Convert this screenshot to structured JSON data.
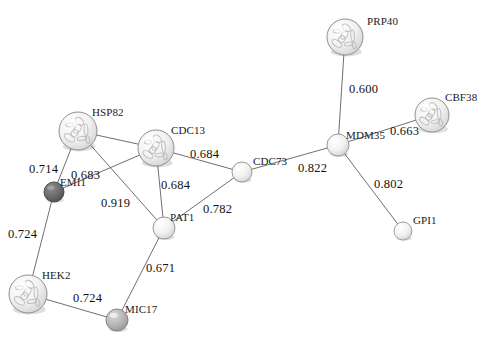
{
  "diagram": {
    "background_color": "#ffffff",
    "edge_color": "#6f6f6f",
    "label_color": "#111111",
    "width": 487,
    "height": 347
  },
  "nodes": [
    {
      "id": "PRP40",
      "label": "PRP40",
      "cx": 345,
      "cy": 37,
      "r": 18,
      "fill": "#e8e8e8",
      "stroke": "#8f8f8f",
      "structured": true,
      "label_dx": 22,
      "label_dy": -22
    },
    {
      "id": "CBF38",
      "label": "CBF38",
      "cx": 432,
      "cy": 115,
      "r": 17,
      "fill": "#e6e6e6",
      "stroke": "#8f8f8f",
      "structured": true,
      "label_dx": 13,
      "label_dy": -24
    },
    {
      "id": "MDM35",
      "label": "MDM35",
      "cx": 338,
      "cy": 145,
      "r": 11,
      "fill": "#efefef",
      "stroke": "#9a9a9a",
      "structured": false,
      "label_dx": 8,
      "label_dy": -16
    },
    {
      "id": "GPI1",
      "label": "GPI1",
      "cx": 403,
      "cy": 231,
      "r": 9,
      "fill": "#f2f2f2",
      "stroke": "#9f9f9f",
      "structured": false,
      "label_dx": 10,
      "label_dy": -17
    },
    {
      "id": "CDC73",
      "label": "CDC73",
      "cx": 242,
      "cy": 172,
      "r": 10,
      "fill": "#f0f0f0",
      "stroke": "#9a9a9a",
      "structured": false,
      "label_dx": 11,
      "label_dy": -17
    },
    {
      "id": "CDC13",
      "label": "CDC13",
      "cx": 156,
      "cy": 148,
      "r": 18,
      "fill": "#ededed",
      "stroke": "#8f8f8f",
      "structured": true,
      "label_dx": 15,
      "label_dy": -24
    },
    {
      "id": "HSP82",
      "label": "HSP82",
      "cx": 78,
      "cy": 131,
      "r": 19,
      "fill": "#ececec",
      "stroke": "#8f8f8f",
      "structured": true,
      "label_dx": 14,
      "label_dy": -25
    },
    {
      "id": "EMI1",
      "label": "EMI1",
      "cx": 54,
      "cy": 192,
      "r": 10,
      "fill": "#6a6a6a",
      "stroke": "#4a4a4a",
      "structured": false,
      "label_dx": 6,
      "label_dy": -16
    },
    {
      "id": "PAT1",
      "label": "PAT1",
      "cx": 164,
      "cy": 228,
      "r": 11,
      "fill": "#ededed",
      "stroke": "#9a9a9a",
      "structured": false,
      "label_dx": 6,
      "label_dy": -17
    },
    {
      "id": "HEK2",
      "label": "HEK2",
      "cx": 28,
      "cy": 294,
      "r": 19,
      "fill": "#ebebeb",
      "stroke": "#8f8f8f",
      "structured": true,
      "label_dx": 14,
      "label_dy": -25
    },
    {
      "id": "MIC17",
      "label": "MIC17",
      "cx": 117,
      "cy": 320,
      "r": 11,
      "fill": "#b4b4b4",
      "stroke": "#858585",
      "structured": false,
      "label_dx": 8,
      "label_dy": -17
    }
  ],
  "edges": [
    {
      "source": "PRP40",
      "target": "MDM35",
      "score": "0.600",
      "label_x": 349,
      "label_y": 82
    },
    {
      "source": "CBF38",
      "target": "MDM35",
      "score": "0.663",
      "label_x": 390,
      "label_y": 124
    },
    {
      "source": "MDM35",
      "target": "GPI1",
      "score": "0.802",
      "label_x": 374,
      "label_y": 177
    },
    {
      "source": "MDM35",
      "target": "CDC73",
      "score": "0.822",
      "label_x": 298,
      "label_y": 161
    },
    {
      "source": "CDC73",
      "target": "CDC13",
      "score": "0.684",
      "label_x": 190,
      "label_y": 147
    },
    {
      "source": "CDC73",
      "target": "PAT1",
      "score": "0.782",
      "label_x": 203,
      "label_y": 202
    },
    {
      "source": "CDC13",
      "target": "PAT1",
      "score": "0.684",
      "label_x": 161,
      "label_y": 178
    },
    {
      "source": "CDC13",
      "target": "EMI1",
      "score": "0.683",
      "label_x": 71,
      "label_y": 168
    },
    {
      "source": "HSP82",
      "target": "EMI1",
      "score": "0.714",
      "label_x": 29,
      "label_y": 162
    },
    {
      "source": "HSP82",
      "target": "PAT1",
      "score": "0.919",
      "label_x": 101,
      "label_y": 196
    },
    {
      "source": "HSP82",
      "target": "CDC13",
      "score": "",
      "label_x": 0,
      "label_y": 0
    },
    {
      "source": "EMI1",
      "target": "HEK2",
      "score": "0.724",
      "label_x": 8,
      "label_y": 227
    },
    {
      "source": "PAT1",
      "target": "MIC17",
      "score": "0.671",
      "label_x": 146,
      "label_y": 261
    },
    {
      "source": "HEK2",
      "target": "MIC17",
      "score": "0.724",
      "label_x": 73,
      "label_y": 291
    }
  ]
}
